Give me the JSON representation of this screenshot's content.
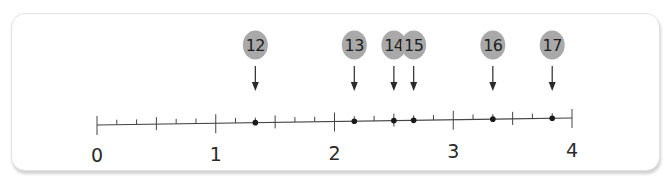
{
  "number_line": {
    "min": 0,
    "max": 4,
    "subdivisions_per_unit": 6,
    "labels": [
      "0",
      "1",
      "2",
      "3",
      "4"
    ],
    "colors": {
      "line": "#444444",
      "marker_fill": "#a9a9a9",
      "marker_text": "#1e1e1e",
      "point": "#1a1a1a"
    }
  },
  "markers": [
    {
      "label": "12",
      "value": "1 2/6",
      "numeric": 1.3333
    },
    {
      "label": "13",
      "value": "2 1/6",
      "numeric": 2.1667
    },
    {
      "label": "14",
      "value": "2 3/6",
      "numeric": 2.5
    },
    {
      "label": "15",
      "value": "2 4/6",
      "numeric": 2.6667
    },
    {
      "label": "16",
      "value": "3 2/6",
      "numeric": 3.3333
    },
    {
      "label": "17",
      "value": "3 5/6",
      "numeric": 3.8333
    }
  ]
}
